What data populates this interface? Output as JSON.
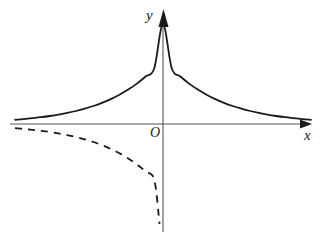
{
  "figure": {
    "background_color": "#ffffff",
    "stroke_color": "#1a1a1a",
    "axis_color": "#555555"
  },
  "labels": {
    "y_axis": "y",
    "x_axis": "x",
    "origin": "O"
  },
  "axes": {
    "x_axis": {
      "y_pixel": 124,
      "x_start": 10,
      "x_end": 312,
      "arrow": "right",
      "label": "x"
    },
    "y_axis": {
      "x_pixel": 163,
      "y_top": 10,
      "y_bottom": 232,
      "arrow": "up",
      "label": "y"
    },
    "origin_pixel": {
      "x": 163,
      "y": 124
    }
  },
  "chart_data": {
    "type": "line",
    "title": "",
    "xlabel": "x",
    "ylabel": "y",
    "grid": false,
    "legend": null,
    "annotations": [
      "O"
    ],
    "axis_ranges": {
      "x": [
        -6.8,
        6.8
      ],
      "y": [
        -2.5,
        1.2
      ]
    },
    "series": [
      {
        "name": "y = a^(-|x|) (solid)",
        "style": "solid",
        "color": "#1a1a1a",
        "width": 1.8,
        "x": [
          -6.8,
          -6.4,
          -6.0,
          -5.6,
          -5.2,
          -4.8,
          -4.4,
          -4.0,
          -3.6,
          -3.2,
          -2.8,
          -2.4,
          -2.0,
          -1.6,
          -1.2,
          -0.8,
          -0.4,
          0.0,
          0.4,
          0.8,
          1.2,
          1.6,
          2.0,
          2.4,
          2.8,
          3.2,
          3.6,
          4.0,
          4.4,
          4.8,
          5.2,
          5.6,
          6.0,
          6.4,
          6.8
        ],
        "y": [
          0.042,
          0.049,
          0.058,
          0.068,
          0.08,
          0.094,
          0.111,
          0.13,
          0.153,
          0.18,
          0.212,
          0.249,
          0.293,
          0.344,
          0.404,
          0.475,
          0.558,
          1.0,
          0.558,
          0.475,
          0.404,
          0.344,
          0.293,
          0.249,
          0.212,
          0.18,
          0.153,
          0.13,
          0.111,
          0.094,
          0.08,
          0.068,
          0.058,
          0.049,
          0.042
        ]
      },
      {
        "name": "reflected left branch (dashed)",
        "style": "dashed",
        "color": "#1a1a1a",
        "width": 1.8,
        "dash_pattern": "7,6",
        "x": [
          -6.8,
          -6.4,
          -6.0,
          -5.6,
          -5.2,
          -4.8,
          -4.4,
          -4.0,
          -3.6,
          -3.2,
          -2.8,
          -2.4,
          -2.0,
          -1.6,
          -1.2,
          -0.8,
          -0.4,
          -0.16
        ],
        "y": [
          -0.042,
          -0.049,
          -0.058,
          -0.068,
          -0.08,
          -0.094,
          -0.111,
          -0.13,
          -0.153,
          -0.18,
          -0.212,
          -0.249,
          -0.293,
          -0.344,
          -0.404,
          -0.475,
          -0.558,
          -1.0
        ]
      }
    ]
  }
}
